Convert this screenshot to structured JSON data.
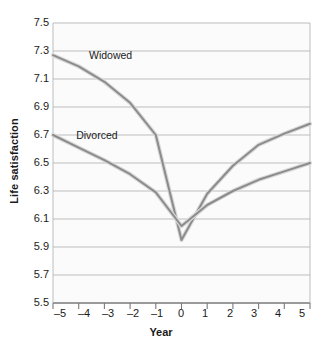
{
  "chart_data": {
    "type": "line",
    "title": "",
    "xlabel": "Year",
    "ylabel": "Life satisfaction",
    "xlim": [
      -5,
      5
    ],
    "ylim": [
      5.5,
      7.5
    ],
    "grid": true,
    "legend_position": "inline-labels",
    "x": [
      -5,
      -4,
      -3,
      -2,
      -1,
      0,
      1,
      2,
      3,
      4,
      5
    ],
    "xtick_labels": [
      "–5",
      "–4",
      "–3",
      "–2",
      "–1",
      "0",
      "1",
      "2",
      "3",
      "4",
      "5"
    ],
    "ytick_labels": [
      "7.5",
      "7.3",
      "7.1",
      "6.9",
      "6.7",
      "6.5",
      "6.3",
      "6.1",
      "5.9",
      "5.7",
      "5.5"
    ],
    "ytick_values": [
      7.5,
      7.3,
      7.1,
      6.9,
      6.7,
      6.5,
      6.3,
      6.1,
      5.9,
      5.7,
      5.5
    ],
    "series": [
      {
        "name": "Widowed",
        "label": "Widowed",
        "color": "#8c8c8c",
        "values": [
          7.27,
          7.19,
          7.08,
          6.93,
          6.7,
          5.95,
          6.28,
          6.48,
          6.63,
          6.71,
          6.78
        ]
      },
      {
        "name": "Divorced",
        "label": "Divorced",
        "color": "#8c8c8c",
        "values": [
          6.7,
          6.61,
          6.52,
          6.42,
          6.29,
          6.05,
          6.2,
          6.3,
          6.38,
          6.44,
          6.5
        ]
      }
    ],
    "annotations": [
      {
        "text": "Widowed",
        "x": -3.6,
        "y": 7.27
      },
      {
        "text": "Divorced",
        "x": -4.1,
        "y": 6.7
      }
    ],
    "colors": {
      "gridline": "#b5b5b5",
      "axis": "#7a7a7a",
      "line": "#8c8c8c",
      "plot_background": "#fbfbfb",
      "text": "#1a1a1a"
    }
  }
}
